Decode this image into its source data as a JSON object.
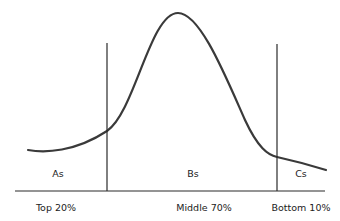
{
  "diagram": {
    "type": "bell-curve-distribution",
    "colors": {
      "curve": "#3a3a3a",
      "lines": "#2a2a2a",
      "text": "#222222",
      "background": "#ffffff"
    },
    "regions": [
      {
        "grade_label": "As",
        "segment_label": "Top 20%"
      },
      {
        "grade_label": "Bs",
        "segment_label": "Middle 70%"
      },
      {
        "grade_label": "Cs",
        "segment_label": "Bottom 10%"
      }
    ]
  }
}
